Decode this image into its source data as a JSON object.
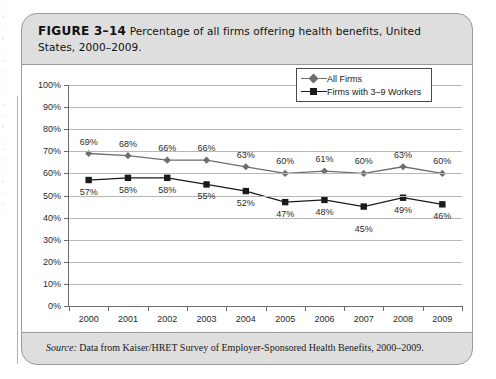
{
  "figure": {
    "number": "FIGURE 3–14",
    "caption": "Percentage of all firms offering health benefits, United States, 2000–2009.",
    "source_label": "Source:",
    "source_text": " Data from Kaiser/HRET Survey of Employer-Sponsored Health Benefits, 2000–2009."
  },
  "chart_data": {
    "type": "line",
    "title": "Percentage of all firms offering health benefits, United States, 2000–2009.",
    "xlabel": "",
    "ylabel": "",
    "categories": [
      "2000",
      "2001",
      "2002",
      "2003",
      "2004",
      "2005",
      "2006",
      "2007",
      "2008",
      "2009"
    ],
    "ylim": [
      0,
      100
    ],
    "ytick_labels": [
      "0%",
      "10%",
      "20%",
      "30%",
      "40%",
      "50%",
      "60%",
      "70%",
      "80%",
      "90%",
      "100%"
    ],
    "ytick_values": [
      0,
      10,
      20,
      30,
      40,
      50,
      60,
      70,
      80,
      90,
      100
    ],
    "grid": "horizontal",
    "legend_position": "top-right",
    "series": [
      {
        "name": "All Firms",
        "marker": "diamond",
        "color": "#6e6e6e",
        "values": [
          69,
          68,
          66,
          66,
          63,
          60,
          61,
          60,
          63,
          60
        ],
        "labels": [
          "69%",
          "68%",
          "66%",
          "66%",
          "63%",
          "60%",
          "61%",
          "60%",
          "63%",
          "60%"
        ],
        "label_positions": [
          "above",
          "above",
          "above",
          "above",
          "above",
          "above",
          "above",
          "above",
          "above",
          "above"
        ]
      },
      {
        "name": "Firms with 3–9 Workers",
        "marker": "square",
        "color": "#1a1a1a",
        "values": [
          57,
          58,
          58,
          55,
          52,
          47,
          48,
          45,
          49,
          46
        ],
        "labels": [
          "57%",
          "58%",
          "58%",
          "55%",
          "52%",
          "47%",
          "48%",
          "45%",
          "49%",
          "46%"
        ],
        "label_positions": [
          "below",
          "below",
          "below",
          "below",
          "below",
          "below",
          "below",
          "below-far",
          "below",
          "below"
        ]
      }
    ]
  },
  "page_bleed": [
    "t",
    "h",
    "e",
    "",
    "b",
    "e",
    "n",
    "",
    "f",
    "i",
    "t",
    "",
    "o",
    "f",
    "",
    "h",
    "e",
    "a",
    "l",
    "t",
    "h",
    "",
    "c",
    "a",
    "r"
  ]
}
